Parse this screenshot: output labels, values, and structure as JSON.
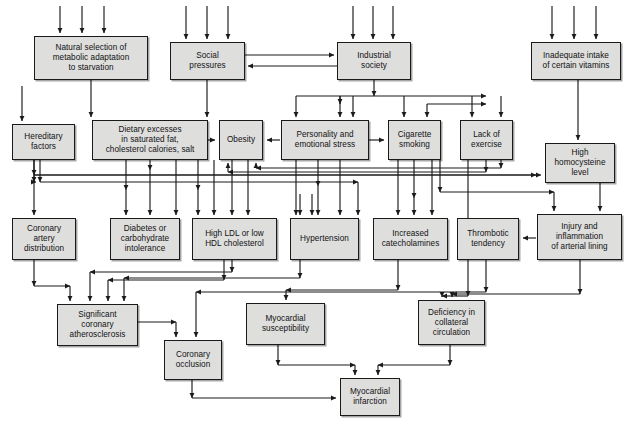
{
  "diagram": {
    "type": "flowchart",
    "box_fill": "#dededd",
    "box_stroke": "#1a1a1a",
    "edge_color": "#1a1a1a",
    "background": "#ffffff"
  },
  "nodes": [
    {
      "id": "natural_selection",
      "label": "Natural selection of\nmetabolic adaptation\nto starvation",
      "x": 34,
      "y": 36,
      "w": 114,
      "h": 44
    },
    {
      "id": "social_pressures",
      "label": "Social\npressures",
      "x": 170,
      "y": 42,
      "w": 75,
      "h": 38
    },
    {
      "id": "industrial_society",
      "label": "Industrial\nsociety",
      "x": 337,
      "y": 42,
      "w": 74,
      "h": 38
    },
    {
      "id": "inadequate_vitamins",
      "label": "Inadequate intake\nof certain vitamins",
      "x": 531,
      "y": 42,
      "w": 90,
      "h": 38
    },
    {
      "id": "hereditary_factors",
      "label": "Hereditary\nfactors",
      "x": 12,
      "y": 124,
      "w": 63,
      "h": 36
    },
    {
      "id": "dietary_excesses",
      "label": "Dietary excesses\nin saturated fat,\ncholesterol calories, salt",
      "x": 92,
      "y": 120,
      "w": 116,
      "h": 40
    },
    {
      "id": "obesity",
      "label": "Obesity",
      "x": 219,
      "y": 120,
      "w": 44,
      "h": 40
    },
    {
      "id": "personality_stress",
      "label": "Personality and\nemotional stress",
      "x": 281,
      "y": 120,
      "w": 88,
      "h": 40
    },
    {
      "id": "cigarette_smoking",
      "label": "Cigarette\nsmoking",
      "x": 388,
      "y": 120,
      "w": 53,
      "h": 40
    },
    {
      "id": "lack_exercise",
      "label": "Lack of\nexercise",
      "x": 460,
      "y": 120,
      "w": 53,
      "h": 40
    },
    {
      "id": "high_homocysteine",
      "label": "High\nhomocysteine\nlevel",
      "x": 545,
      "y": 143,
      "w": 70,
      "h": 40
    },
    {
      "id": "coronary_artery_distribution",
      "label": "Coronary\nartery\ndistribution",
      "x": 12,
      "y": 218,
      "w": 64,
      "h": 42
    },
    {
      "id": "diabetes",
      "label": "Diabetes or\ncarbohydrate\nintolerance",
      "x": 110,
      "y": 218,
      "w": 70,
      "h": 42
    },
    {
      "id": "high_ldl",
      "label": "High LDL or low\nHDL cholesterol",
      "x": 192,
      "y": 218,
      "w": 85,
      "h": 42
    },
    {
      "id": "hypertension",
      "label": "Hypertension",
      "x": 290,
      "y": 218,
      "w": 69,
      "h": 42
    },
    {
      "id": "increased_catecholamines",
      "label": "Increased\ncatecholamines",
      "x": 373,
      "y": 218,
      "w": 75,
      "h": 42
    },
    {
      "id": "thrombotic_tendency",
      "label": "Thrombotic\ntendency",
      "x": 457,
      "y": 218,
      "w": 62,
      "h": 42
    },
    {
      "id": "injury_inflammation",
      "label": "Injury and\ninflammation\nof arterial lining",
      "x": 537,
      "y": 214,
      "w": 85,
      "h": 46
    },
    {
      "id": "significant_atherosclerosis",
      "label": "Significant\ncoronary\natherosclerosis",
      "x": 57,
      "y": 304,
      "w": 81,
      "h": 42
    },
    {
      "id": "coronary_occlusion",
      "label": "Coronary\nocclusion",
      "x": 164,
      "y": 340,
      "w": 58,
      "h": 40
    },
    {
      "id": "myocardial_susceptibility",
      "label": "Myocardial\nsusceptibility",
      "x": 246,
      "y": 303,
      "w": 79,
      "h": 42
    },
    {
      "id": "deficiency_collateral",
      "label": "Deficiency in\ncollateral\ncirculation",
      "x": 418,
      "y": 300,
      "w": 67,
      "h": 45
    },
    {
      "id": "myocardial_infarction",
      "label": "Myocardial\ninfarction",
      "x": 340,
      "y": 378,
      "w": 60,
      "h": 38
    }
  ],
  "edges": [
    {
      "from": "external",
      "to": "natural_selection",
      "kind": "inbound-top"
    },
    {
      "from": "external",
      "to": "social_pressures",
      "kind": "inbound-top"
    },
    {
      "from": "external",
      "to": "industrial_society",
      "kind": "inbound-top"
    },
    {
      "from": "external",
      "to": "inadequate_vitamins",
      "kind": "inbound-top"
    },
    {
      "from": "social_pressures",
      "to": "industrial_society",
      "kind": "bidirectional"
    },
    {
      "from": "industrial_society",
      "to": "social_pressures",
      "kind": "bidirectional"
    },
    {
      "from": "natural_selection",
      "to": "hereditary_factors"
    },
    {
      "from": "natural_selection",
      "to": "dietary_excesses"
    },
    {
      "from": "social_pressures",
      "to": "obesity"
    },
    {
      "from": "industrial_society",
      "to": "personality_stress"
    },
    {
      "from": "industrial_society",
      "to": "cigarette_smoking"
    },
    {
      "from": "industrial_society",
      "to": "lack_exercise"
    },
    {
      "from": "dietary_excesses",
      "to": "obesity"
    },
    {
      "from": "personality_stress",
      "to": "obesity"
    },
    {
      "from": "personality_stress",
      "to": "cigarette_smoking"
    },
    {
      "from": "inadequate_vitamins",
      "to": "high_homocysteine"
    },
    {
      "from": "hereditary_factors",
      "to": "coronary_artery_distribution"
    },
    {
      "from": "hereditary_factors",
      "to": "high_homocysteine"
    },
    {
      "from": "dietary_excesses",
      "to": "diabetes"
    },
    {
      "from": "dietary_excesses",
      "to": "high_ldl"
    },
    {
      "from": "obesity",
      "to": "high_ldl"
    },
    {
      "from": "obesity",
      "to": "hypertension"
    },
    {
      "from": "lack_exercise",
      "to": "obesity"
    },
    {
      "from": "personality_stress",
      "to": "hypertension"
    },
    {
      "from": "personality_stress",
      "to": "increased_catecholamines"
    },
    {
      "from": "cigarette_smoking",
      "to": "increased_catecholamines"
    },
    {
      "from": "cigarette_smoking",
      "to": "injury_inflammation"
    },
    {
      "from": "high_ldl",
      "to": "injury_inflammation"
    },
    {
      "from": "hypertension",
      "to": "injury_inflammation"
    },
    {
      "from": "high_homocysteine",
      "to": "injury_inflammation"
    },
    {
      "from": "injury_inflammation",
      "to": "thrombotic_tendency"
    },
    {
      "from": "coronary_artery_distribution",
      "to": "significant_atherosclerosis"
    },
    {
      "from": "high_ldl",
      "to": "significant_atherosclerosis"
    },
    {
      "from": "hypertension",
      "to": "significant_atherosclerosis"
    },
    {
      "from": "significant_atherosclerosis",
      "to": "coronary_occlusion"
    },
    {
      "from": "thrombotic_tendency",
      "to": "coronary_occlusion"
    },
    {
      "from": "increased_catecholamines",
      "to": "myocardial_susceptibility"
    },
    {
      "from": "injury_inflammation",
      "to": "deficiency_collateral"
    },
    {
      "from": "lack_exercise",
      "to": "deficiency_collateral"
    },
    {
      "from": "coronary_occlusion",
      "to": "myocardial_infarction"
    },
    {
      "from": "myocardial_susceptibility",
      "to": "myocardial_infarction"
    },
    {
      "from": "deficiency_collateral",
      "to": "myocardial_infarction"
    }
  ]
}
